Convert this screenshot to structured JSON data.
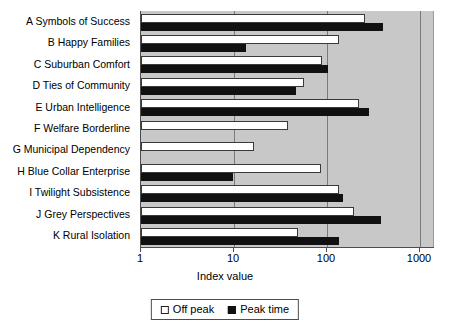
{
  "chart_data": {
    "type": "bar",
    "orientation": "horizontal",
    "title": "",
    "xlabel": "Index value",
    "ylabel": "",
    "xscale": "log",
    "xlim": [
      1,
      1000
    ],
    "xticks": [
      "1",
      "10",
      "100",
      "1000"
    ],
    "grid": true,
    "legend_position": "bottom",
    "categories": [
      "A Symbols of Success",
      "B Happy Families",
      "C Suburban Comfort",
      "D Ties of Community",
      "E Urban Intelligence",
      "F Welfare Borderline",
      "G Municipal Dependency",
      "H Blue Collar Enterprise",
      "I Twilight Subsistence",
      "J Grey Perspectives",
      "K Rural Isolation"
    ],
    "series": [
      {
        "name": "Off peak",
        "color": "#ffffff",
        "values": [
          257,
          134,
          88,
          56,
          220,
          38,
          16.5,
          86,
          136,
          197,
          49
        ]
      },
      {
        "name": "Peak time",
        "color": "#111111",
        "values": [
          400,
          13.4,
          103,
          46,
          283,
          0,
          0,
          9.8,
          147,
          383,
          136
        ]
      }
    ]
  },
  "axis": {
    "x_title": "Index value",
    "tick_labels": [
      "1",
      "10",
      "100",
      "1000"
    ]
  },
  "legend": {
    "items": [
      {
        "label": "Off peak",
        "swatch": "white-square-icon"
      },
      {
        "label": "Peak time",
        "swatch": "black-square-icon"
      }
    ]
  }
}
